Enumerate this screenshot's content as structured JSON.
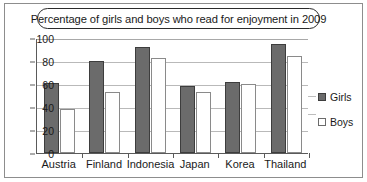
{
  "chart_data": {
    "type": "bar",
    "title": "Percentage of girls and boys who read for enjoyment in 2009",
    "xlabel": "",
    "ylabel": "",
    "ylim": [
      0,
      100
    ],
    "yticks": [
      0,
      20,
      40,
      60,
      80,
      100
    ],
    "grid": true,
    "legend_position": "right",
    "categories": [
      "Austria",
      "Finland",
      "Indonesia",
      "Japan",
      "Korea",
      "Thailand"
    ],
    "series": [
      {
        "name": "Girls",
        "color": "#6b6b6b",
        "values": [
          61,
          80,
          92,
          58,
          62,
          95
        ]
      },
      {
        "name": "Boys",
        "color": "#ffffff",
        "values": [
          38,
          53,
          83,
          53,
          60,
          84
        ]
      }
    ]
  },
  "legend": {
    "items": [
      {
        "label": "Girls"
      },
      {
        "label": "Boys"
      }
    ]
  },
  "colors": {
    "girls_fill": "#6b6b6b",
    "girls_border": "#3d3d3d",
    "boys_fill": "#ffffff",
    "boys_border": "#8a8a8a",
    "axis": "#5a5a5a",
    "gridline": "#b9b9b9",
    "frame": "#8d8d8d",
    "text": "#1a1a1a"
  }
}
